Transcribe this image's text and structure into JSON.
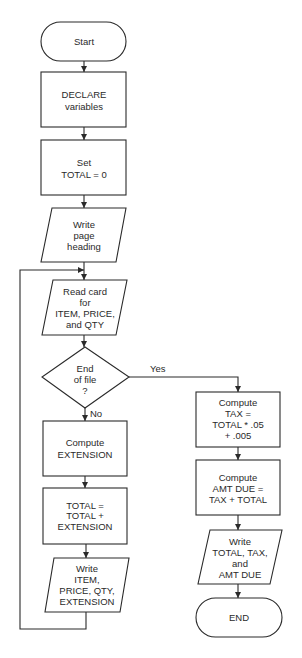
{
  "flowchart": {
    "start": {
      "label": [
        "Start"
      ]
    },
    "declare": {
      "label": [
        "DECLARE",
        "variables"
      ]
    },
    "set_total": {
      "label": [
        "Set",
        "TOTAL = 0"
      ]
    },
    "write_heading": {
      "label": [
        "Write",
        "page",
        "heading"
      ]
    },
    "read_card": {
      "label": [
        "Read card",
        "for",
        "ITEM, PRICE,",
        "and QTY"
      ]
    },
    "end_of_file": {
      "label": [
        "End",
        "of file",
        "?"
      ]
    },
    "compute_extension": {
      "label": [
        "Compute",
        "EXTENSION"
      ]
    },
    "accumulate_total": {
      "label": [
        "TOTAL =",
        "TOTAL +",
        "EXTENSION"
      ]
    },
    "write_item": {
      "label": [
        "Write",
        "ITEM,",
        "PRICE, QTY,",
        "EXTENSION"
      ]
    },
    "compute_tax": {
      "label": [
        "Compute",
        "TAX =",
        "TOTAL * .05",
        "+ .005"
      ]
    },
    "compute_amt_due": {
      "label": [
        "Compute",
        "AMT DUE =",
        "TAX + TOTAL"
      ]
    },
    "write_totals": {
      "label": [
        "Write",
        "TOTAL, TAX,",
        "and",
        "AMT DUE"
      ]
    },
    "end": {
      "label": [
        "END"
      ]
    },
    "edge_labels": {
      "yes": "Yes",
      "no": "No"
    }
  }
}
